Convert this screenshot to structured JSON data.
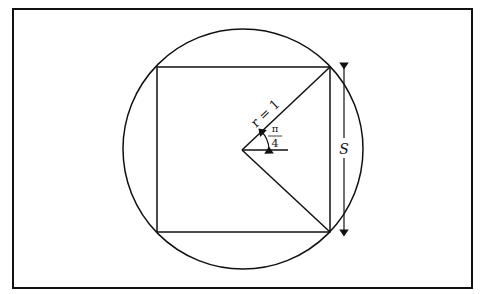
{
  "diagram": {
    "colors": {
      "stroke": "#111111",
      "background": "#ffffff"
    },
    "frame": {
      "x": 13,
      "y": 9,
      "width": 459,
      "height": 279
    },
    "circle": {
      "cx": 243,
      "cy": 149,
      "r": 120
    },
    "square": {
      "x1": 157,
      "y1": 67,
      "x2": 330,
      "y2": 232
    },
    "center": {
      "x": 242,
      "y": 150
    },
    "labels": {
      "radius": "r = 1",
      "angle_numerator": "π",
      "angle_denominator": "4",
      "side": "S"
    }
  }
}
